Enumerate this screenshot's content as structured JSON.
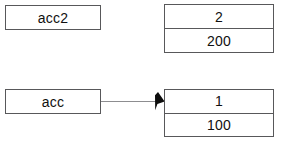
{
  "diagram": {
    "type": "object-reference-diagram",
    "background_color": "#ffffff",
    "line_color": "#58585a",
    "connector_color": "#8d8d90",
    "text_color": "#101010",
    "variables": [
      {
        "id": "acc2",
        "label": "acc2"
      },
      {
        "id": "acc",
        "label": "acc"
      }
    ],
    "objects": [
      {
        "id": "obj2",
        "rows": [
          {
            "field": "id",
            "value": "2"
          },
          {
            "field": "balance",
            "value": "200"
          }
        ]
      },
      {
        "id": "obj1",
        "rows": [
          {
            "field": "id",
            "value": "1"
          },
          {
            "field": "balance",
            "value": "100"
          }
        ]
      }
    ],
    "connections": [
      {
        "from": "acc",
        "to": "obj1",
        "arrow": "filled-triangle"
      }
    ]
  }
}
